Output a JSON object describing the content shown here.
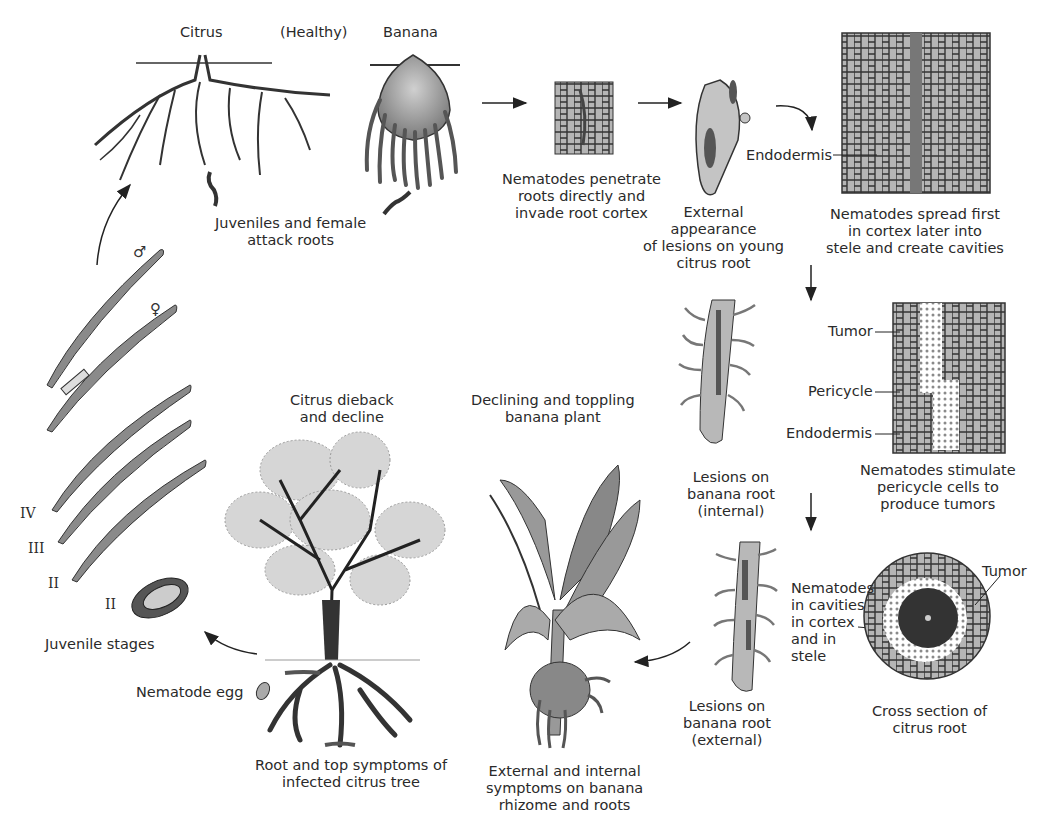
{
  "diagram": {
    "type": "disease-cycle",
    "colors": {
      "nematode": "#8a8a8a",
      "lesion": "#555555",
      "tissue": "#b8b8b8",
      "line": "#222222"
    }
  },
  "top": {
    "citrus_label": "Citrus",
    "healthy_label": "(Healthy)",
    "banana_label": "Banana",
    "attack_caption": "Juveniles and female\nattack roots"
  },
  "stages": {
    "penetrate_caption": "Nematodes penetrate\nroots directly and\ninvade root cortex",
    "external_caption": "External\nappearance\nof lesions on young\ncitrus root",
    "endodermis_label_1": "Endodermis",
    "spread_caption": "Nematodes spread first\nin cortex later into\nstele and create cavities",
    "lesion_internal_caption": "Lesions on\nbanana root\n(internal)",
    "tumor_label_1": "Tumor",
    "pericycle_label": "Pericycle",
    "endodermis_label_2": "Endodermis",
    "stimulate_caption": "Nematodes stimulate\npericycle cells to\nproduce tumors",
    "cavities_caption": "Nematodes\nin cavities\nin cortex\nand in\nstele",
    "lesion_external_caption": "Lesions on\nbanana root\n(external)",
    "tumor_label_2": "Tumor",
    "cross_section_caption": "Cross section of\ncitrus root"
  },
  "bottom": {
    "citrus_dieback_title": "Citrus dieback\nand decline",
    "banana_decline_title": "Declining and toppling\nbanana plant",
    "citrus_symptoms_caption": "Root and top symptoms of\ninfected citrus tree",
    "banana_symptoms_caption": "External and internal\nsymptoms on banana\nrhizome and roots",
    "egg_label": "Nematode egg"
  },
  "juveniles": {
    "male_symbol": "♂",
    "female_symbol": "♀",
    "stage_iv": "IV",
    "stage_iii": "III",
    "stage_ii": "II",
    "stage_ii_egg": "II",
    "caption": "Juvenile stages"
  }
}
